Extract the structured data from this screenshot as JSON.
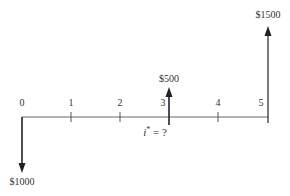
{
  "diagram": {
    "type": "cash-flow-diagram",
    "axis": {
      "periods": [
        "0",
        "1",
        "2",
        "3",
        "4",
        "5"
      ]
    },
    "cash_flows": [
      {
        "period": "0",
        "amount_label": "$1000",
        "direction": "down"
      },
      {
        "period": "3",
        "amount_label": "$500",
        "direction": "up"
      },
      {
        "period": "5",
        "amount_label": "$1500",
        "direction": "up"
      }
    ],
    "rate_label": {
      "symbol": "i",
      "superscript": "*",
      "rest": " = ?"
    },
    "colors": {
      "line": "#555555",
      "arrow": "#222222",
      "text": "#333333"
    }
  }
}
